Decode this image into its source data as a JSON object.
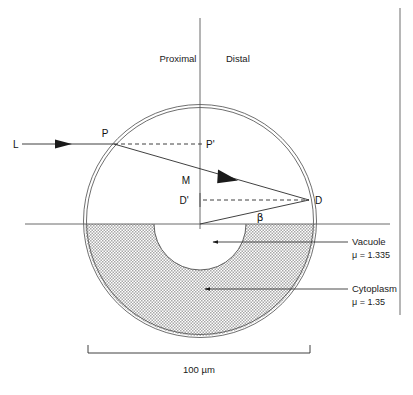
{
  "figure": {
    "background_color": "#ffffff",
    "line_color": "#2b2b2b",
    "cytoplasm_fill": "#c9c9c9",
    "vacuole_fill": "#ffffff"
  },
  "orientation_labels": {
    "proximal": "Proximal",
    "distal": "Distal"
  },
  "ray_labels": {
    "incident": "L",
    "entry_point": "P",
    "entry_projection": "P'",
    "midpoint": "M",
    "exit_projection": "D'",
    "exit_point": "D",
    "angle": "β"
  },
  "region_labels": [
    {
      "name": "Vacuole",
      "refractive_index": "μ = 1.335"
    },
    {
      "name": "Cytoplasm",
      "refractive_index": "μ = 1.35"
    }
  ],
  "scale_bar": {
    "label": "100 µm",
    "value": 100,
    "unit": "µm"
  },
  "geometry": {
    "cell_center": {
      "x": 200,
      "y": 221
    },
    "cell_radius": 116,
    "vacuole_center": {
      "x": 200,
      "y": 224
    },
    "vacuole_radius": 46,
    "horizontal_axis_y": 224,
    "vertical_axis_x": 200,
    "entry_point": {
      "x": 114,
      "y": 144
    },
    "exit_point": {
      "x": 309,
      "y": 200
    }
  }
}
